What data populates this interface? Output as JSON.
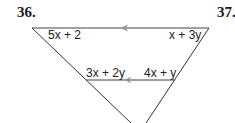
{
  "problems": {
    "left_number": "36.",
    "right_number": "37."
  },
  "diagram": {
    "type": "triangle with parallel segment",
    "top_segment": {
      "left_label": "5x + 2",
      "right_label": "x + 3y",
      "arrow_direction": "left"
    },
    "middle_segment": {
      "left_label": "3x + 2y",
      "right_label": "4x + y",
      "arrow_direction": "left"
    },
    "colors": {
      "line": "#333333",
      "arrow": "#999999"
    }
  }
}
